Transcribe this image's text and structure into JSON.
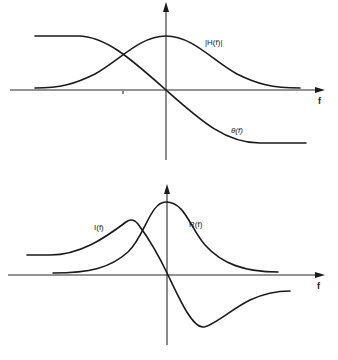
{
  "figure": {
    "top_panel": {
      "x_axis_label": "f",
      "curves": [
        {
          "name": "magnitude",
          "label": "|H(f)|"
        },
        {
          "name": "phase",
          "label": "θ(f)"
        }
      ]
    },
    "bottom_panel": {
      "x_axis_label": "f",
      "curves": [
        {
          "name": "imaginary-part",
          "label": "I(f)"
        },
        {
          "name": "real-part",
          "label": "R(f)"
        }
      ]
    },
    "colors": {
      "ink": "#1a1a1a",
      "background": "#ffffff"
    }
  }
}
